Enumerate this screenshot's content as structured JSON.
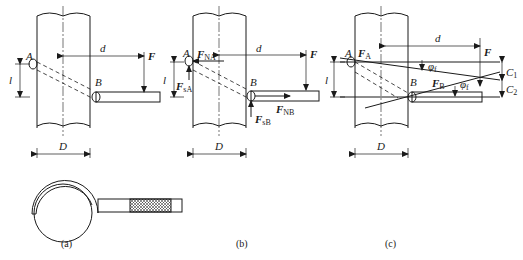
{
  "figure": {
    "panels": [
      {
        "id": "a",
        "caption": "(a)",
        "labels": {
          "A": "A",
          "B": "B",
          "d": "d",
          "F": "F",
          "l": "l",
          "D": "D"
        }
      },
      {
        "id": "b",
        "caption": "(b)",
        "labels": {
          "A": "A",
          "B": "B",
          "d": "d",
          "F": "F",
          "l": "l",
          "D": "D",
          "FNA_main": "F",
          "FNA_sub": "NA",
          "FsA_main": "F",
          "FsA_sub": "sA",
          "FNB_main": "F",
          "FNB_sub": "NB",
          "FsB_main": "F",
          "FsB_sub": "sB"
        }
      },
      {
        "id": "c",
        "caption": "(c)",
        "labels": {
          "A": "A",
          "B": "B",
          "d": "d",
          "F": "F",
          "l": "l",
          "D": "D",
          "FA_main": "F",
          "FA_sub": "A",
          "FB_main": "F",
          "FB_sub": "B",
          "phi1_main": "φ",
          "phi1_sub": "f",
          "phi2_main": "φ",
          "phi2_sub": "f",
          "C1_main": "C",
          "C1_sub": "1",
          "C2_main": "C",
          "C2_sub": "2"
        }
      }
    ]
  }
}
